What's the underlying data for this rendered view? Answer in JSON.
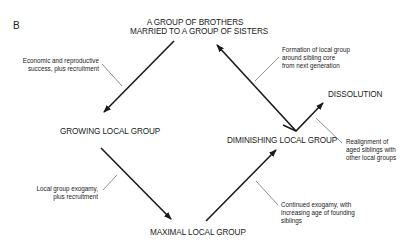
{
  "panel_label": "B",
  "nodes": {
    "top_line1": "A GROUP OF BROTHERS",
    "top_line2": "MARRIED TO A GROUP OF SISTERS",
    "growing": "GROWING LOCAL GROUP",
    "maximal": "MAXIMAL LOCAL GROUP",
    "diminishing": "DIMINISHING LOCAL GROUP",
    "dissolution": "DISSOLUTION"
  },
  "annotations": {
    "economic": [
      "Economic and reproductive",
      "success, plus recruitment"
    ],
    "exogamy": [
      "Local group exogamy,",
      "plus recruitment"
    ],
    "continued": [
      "Continued exogamy, with",
      "increasing age of founding",
      "siblings"
    ],
    "formation": [
      "Formation of local group",
      "around sibling core",
      "from next generation"
    ],
    "realignment": [
      "Realignment of",
      "aged siblings with",
      "other local groups"
    ]
  },
  "colors": {
    "line": "#1a1a1a",
    "pointer": "#444444"
  }
}
